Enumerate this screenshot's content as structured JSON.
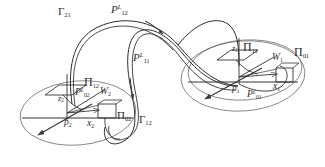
{
  "figure": {
    "background": "#ffffff",
    "stroke_color": "#3a3a3a",
    "text_color": "#2b2b2b",
    "width": 325,
    "height": 167
  },
  "labels": {
    "gamma21": {
      "base": "Γ",
      "sub": "21"
    },
    "gamma12": {
      "base": "Γ",
      "sub": "12"
    },
    "p12L": {
      "base": "P",
      "sub": "12",
      "sup": "L"
    },
    "p11L": {
      "base": "P",
      "sub": "11",
      "sup": "L"
    },
    "p02L": {
      "base": "P",
      "sub": "02",
      "sup": "L"
    },
    "p01L": {
      "base": "P",
      "sub": "01",
      "sup": "L"
    },
    "pi12": {
      "base": "Π",
      "sub": "12"
    },
    "pi02": {
      "base": "Π",
      "sub": "02"
    },
    "pi11": {
      "base": "Π",
      "sub": "11"
    },
    "pi01": {
      "base": "Π",
      "sub": "01"
    },
    "w1": {
      "base": "W",
      "sub": "1"
    },
    "w2": {
      "base": "W",
      "sub": "2"
    },
    "p1": {
      "base": "p",
      "sub": "1"
    },
    "p2": {
      "base": "p",
      "sub": "2"
    },
    "x1": {
      "base": "x",
      "sub": "1"
    },
    "x2": {
      "base": "x",
      "sub": "2"
    },
    "z1": {
      "base": "z",
      "sub": "1"
    },
    "z2": {
      "base": "z",
      "sub": "2"
    }
  },
  "text": {
    "gamma21": "Γ21",
    "gamma12": "Γ12",
    "p12L": "P12L",
    "p11L": "P11L",
    "p02L": "P02L",
    "p01L": "P01L",
    "pi12": "Π12",
    "pi02": "Π02",
    "pi11": "Π11",
    "pi01": "Π01",
    "w1": "W1",
    "w2": "W2",
    "p1": "p1",
    "p2": "p2",
    "x1": "x1",
    "x2": "x2",
    "z1": "z1",
    "z2": "z2"
  }
}
